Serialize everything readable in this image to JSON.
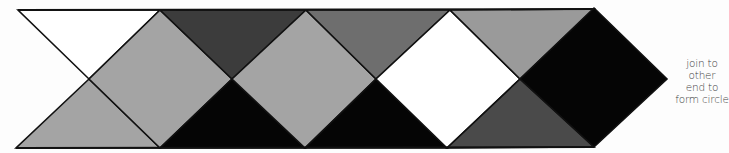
{
  "diagram": {
    "type": "paper-craft-pattern-strip",
    "colors": {
      "white": "#ffffff",
      "light_gray": "#a4a4a4",
      "mid_gray": "#9a9a9a",
      "medium_dark_gray": "#6e6e6e",
      "dark_gray": "#3c3c3c",
      "darker_gray": "#4a4a4a",
      "black": "#050505",
      "outline": "#111111"
    },
    "shapes": [
      {
        "id": "tri-top-1",
        "fill": "#ffffff",
        "points": "18,10 160,10 89,79"
      },
      {
        "id": "tri-bottom-1",
        "fill": "#a4a4a4",
        "points": "16,148 160,148 89,79"
      },
      {
        "id": "diamond-1",
        "fill": "#a4a4a4",
        "points": "160,10 232,79 160,148 89,79"
      },
      {
        "id": "tri-top-2",
        "fill": "#3c3c3c",
        "points": "160,10 306,10 232,79"
      },
      {
        "id": "tri-bottom-2",
        "fill": "#050505",
        "points": "160,148 305,148 232,79"
      },
      {
        "id": "diamond-2",
        "fill": "#a4a4a4",
        "points": "306,10 376,79 305,148 232,79"
      },
      {
        "id": "tri-top-3",
        "fill": "#6e6e6e",
        "points": "306,10 450,10 376,79"
      },
      {
        "id": "tri-bottom-3",
        "fill": "#050505",
        "points": "305,148 447,148 376,79"
      },
      {
        "id": "diamond-3",
        "fill": "#ffffff",
        "points": "450,10 520,79 447,148 376,79"
      },
      {
        "id": "tri-top-4",
        "fill": "#9a9a9a",
        "points": "450,10 594,9 520,79"
      },
      {
        "id": "tri-bottom-4",
        "fill": "#4a4a4a",
        "points": "447,148 594,147 520,79"
      },
      {
        "id": "diamond-4",
        "fill": "#050505",
        "points": "594,8 667,79 594,147 520,79"
      }
    ],
    "annotation": {
      "lines": [
        "join to",
        "other",
        "end to",
        "form circle"
      ]
    }
  }
}
